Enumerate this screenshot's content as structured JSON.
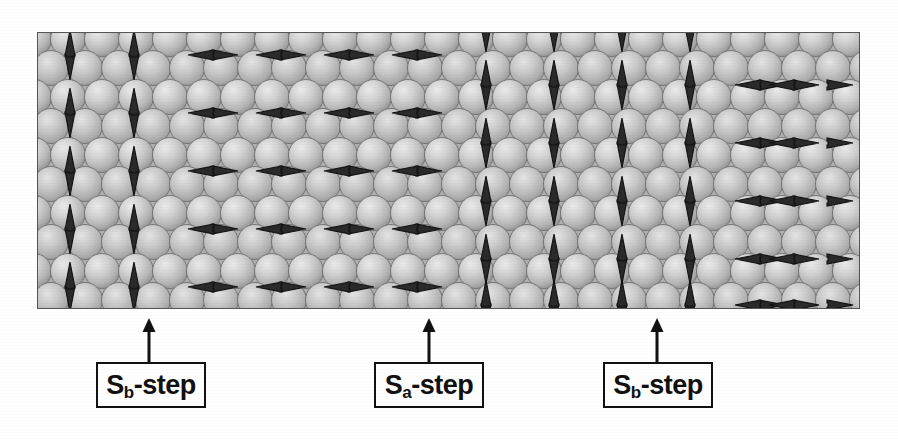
{
  "figure": {
    "name": "magnetic-spin-step-structure",
    "background_color": "#ffffff",
    "frame": {
      "x": 37,
      "y": 32,
      "width": 821,
      "height": 275,
      "border_color": "#555555",
      "fill_color": "#b9b9b9"
    },
    "sphere": {
      "diameter": 34,
      "row_height": 29,
      "fill_light": "#e2e2e2",
      "fill_mid": "#c2c2c2",
      "fill_dark": "#9a9a9a",
      "outline_color": "#6e6e6e"
    },
    "arrow": {
      "color": "#2a2a2a",
      "outline_color": "#111111",
      "length": 26,
      "half_width": 5
    },
    "domains": [
      {
        "name": "left-vertical-domain",
        "orientation": "vertical",
        "columns": 2,
        "rows": 4,
        "phase": "even"
      },
      {
        "name": "center-horizontal-domain",
        "orientation": "horizontal",
        "columns": 4,
        "rows": 4,
        "phase": "even"
      },
      {
        "name": "middle-vertical-domain",
        "orientation": "vertical",
        "columns": 4,
        "rows": 4,
        "phase": "odd"
      },
      {
        "name": "right-horizontal-domain",
        "orientation": "horizontal",
        "columns": 3,
        "rows": 4,
        "phase": "odd"
      }
    ]
  },
  "labels": [
    {
      "id": "label-sb-step-left",
      "prefix": "S",
      "subscript": "b",
      "suffix": "-step",
      "full_text": "Sb-step",
      "box": {
        "x": 96,
        "y": 362,
        "width": 110,
        "height": 46
      },
      "pointer": {
        "x": 148,
        "y_top": 320,
        "y_bottom": 362
      }
    },
    {
      "id": "label-sa-step-center",
      "prefix": "S",
      "subscript": "a",
      "suffix": "-step",
      "full_text": "Sa-step",
      "box": {
        "x": 374,
        "y": 362,
        "width": 110,
        "height": 46
      },
      "pointer": {
        "x": 428,
        "y_top": 320,
        "y_bottom": 362
      }
    },
    {
      "id": "label-sb-step-right",
      "prefix": "S",
      "subscript": "b",
      "suffix": "-step",
      "full_text": "Sb-step",
      "box": {
        "x": 603,
        "y": 362,
        "width": 110,
        "height": 46
      },
      "pointer": {
        "x": 656,
        "y_top": 320,
        "y_bottom": 362
      }
    }
  ]
}
